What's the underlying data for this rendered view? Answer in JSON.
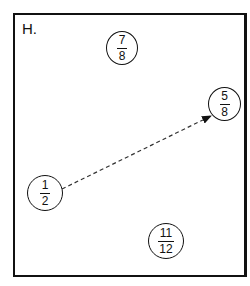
{
  "panel": {
    "label": "H.",
    "border_color": "#111111"
  },
  "fractions": [
    {
      "id": "seven-eighths",
      "numerator": "7",
      "denominator": "8",
      "cx": 121,
      "cy": 47,
      "r": 16
    },
    {
      "id": "five-eighths",
      "numerator": "5",
      "denominator": "8",
      "cx": 224,
      "cy": 104,
      "r": 16
    },
    {
      "id": "one-half",
      "numerator": "1",
      "denominator": "2",
      "cx": 45,
      "cy": 193,
      "r": 17
    },
    {
      "id": "eleven-twelfths",
      "numerator": "11",
      "denominator": "12",
      "cx": 165,
      "cy": 241,
      "r": 17
    }
  ],
  "arrow": {
    "from": "one-half",
    "to": "five-eighths",
    "style": "dashed"
  }
}
